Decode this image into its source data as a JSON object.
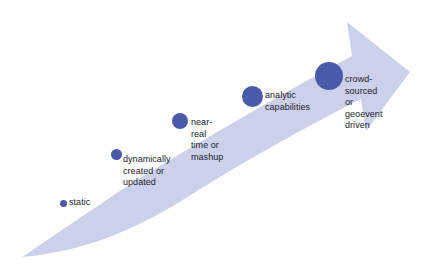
{
  "figure": {
    "type": "progression-arrow-diagram",
    "orientation": "ascending-left-to-right",
    "colors": {
      "arrow_band": "#ccd0ea",
      "node_fill": "#4a5aa8",
      "text": "#1b1b2e",
      "background": "#ffffff"
    }
  },
  "nodes": [
    {
      "id": "static",
      "label": "static",
      "dot_diameter": 7,
      "dot_cx": 63,
      "dot_cy": 203,
      "label_x": 69,
      "label_y": 197
    },
    {
      "id": "dynamically-created-or-updated",
      "label": "dynamically\ncreated or\nupdated",
      "dot_diameter": 11,
      "dot_cx": 116,
      "dot_cy": 154,
      "label_x": 123,
      "label_y": 154
    },
    {
      "id": "near-real-time-or-mashup",
      "label": "near-real\ntime or\nmashup",
      "dot_diameter": 16,
      "dot_cx": 180,
      "dot_cy": 121,
      "label_x": 191,
      "label_y": 117
    },
    {
      "id": "analytic-capabilities",
      "label": "analytic\ncapabilities",
      "dot_diameter": 21,
      "dot_cx": 252,
      "dot_cy": 96,
      "label_x": 265,
      "label_y": 90
    },
    {
      "id": "crowd-sourced-or-geoevent-driven",
      "label": "crowd-\nsourced or\ngeoevent\ndriven",
      "dot_diameter": 28,
      "dot_cx": 329,
      "dot_cy": 76,
      "label_x": 345,
      "label_y": 74
    }
  ]
}
